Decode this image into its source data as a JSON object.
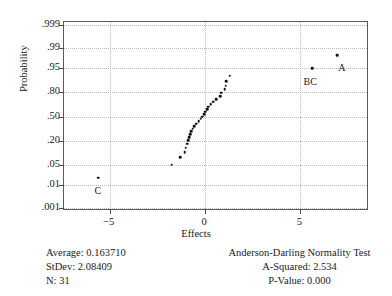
{
  "chart_data": {
    "type": "scatter",
    "title": "",
    "xlabel": "Effects",
    "ylabel": "Probability",
    "xlim": [
      -7.4,
      8.6
    ],
    "ylim_prob": [
      0.0007,
      0.9993
    ],
    "grid": true,
    "legend": "none",
    "x_ticks": [
      {
        "value": -5,
        "label": "−5"
      },
      {
        "value": 0,
        "label": "0"
      },
      {
        "value": 5,
        "label": "5"
      }
    ],
    "y_ticks": [
      {
        "value": 0.999,
        "label": ".999"
      },
      {
        "value": 0.99,
        "label": ".99"
      },
      {
        "value": 0.95,
        "label": ".95"
      },
      {
        "value": 0.8,
        "label": ".80"
      },
      {
        "value": 0.5,
        "label": ".50"
      },
      {
        "value": 0.2,
        "label": ".20"
      },
      {
        "value": 0.05,
        "label": ".05"
      },
      {
        "value": 0.01,
        "label": ".01"
      },
      {
        "value": 0.001,
        "label": ".001"
      }
    ],
    "points": [
      {
        "x": -5.62,
        "p": 0.019,
        "label": "C",
        "label_dx": 0,
        "label_dy": 7
      },
      {
        "x": -1.76,
        "p": 0.051,
        "label": "",
        "label_dx": 0,
        "label_dy": 0
      },
      {
        "x": -1.3,
        "p": 0.083,
        "label": "",
        "label_dx": 0,
        "label_dy": 0
      },
      {
        "x": -1.07,
        "p": 0.115,
        "label": "",
        "label_dx": 0,
        "label_dy": 0
      },
      {
        "x": -1.01,
        "p": 0.147,
        "label": "",
        "label_dx": 0,
        "label_dy": 0
      },
      {
        "x": -0.95,
        "p": 0.18,
        "label": "",
        "label_dx": 0,
        "label_dy": 0
      },
      {
        "x": -0.9,
        "p": 0.212,
        "label": "",
        "label_dx": 0,
        "label_dy": 0
      },
      {
        "x": -0.84,
        "p": 0.244,
        "label": "",
        "label_dx": 0,
        "label_dy": 0
      },
      {
        "x": -0.78,
        "p": 0.276,
        "label": "",
        "label_dx": 0,
        "label_dy": 0
      },
      {
        "x": -0.72,
        "p": 0.308,
        "label": "",
        "label_dx": 0,
        "label_dy": 0
      },
      {
        "x": -0.64,
        "p": 0.34,
        "label": "",
        "label_dx": 0,
        "label_dy": 0
      },
      {
        "x": -0.56,
        "p": 0.372,
        "label": "",
        "label_dx": 0,
        "label_dy": 0
      },
      {
        "x": -0.48,
        "p": 0.404,
        "label": "",
        "label_dx": 0,
        "label_dy": 0
      },
      {
        "x": -0.34,
        "p": 0.436,
        "label": "",
        "label_dx": 0,
        "label_dy": 0
      },
      {
        "x": -0.22,
        "p": 0.468,
        "label": "",
        "label_dx": 0,
        "label_dy": 0
      },
      {
        "x": -0.14,
        "p": 0.5,
        "label": "",
        "label_dx": 0,
        "label_dy": 0
      },
      {
        "x": -0.06,
        "p": 0.532,
        "label": "",
        "label_dx": 0,
        "label_dy": 0
      },
      {
        "x": 0.02,
        "p": 0.564,
        "label": "",
        "label_dx": 0,
        "label_dy": 0
      },
      {
        "x": 0.1,
        "p": 0.596,
        "label": "",
        "label_dx": 0,
        "label_dy": 0
      },
      {
        "x": 0.18,
        "p": 0.628,
        "label": "",
        "label_dx": 0,
        "label_dy": 0
      },
      {
        "x": 0.3,
        "p": 0.66,
        "label": "",
        "label_dx": 0,
        "label_dy": 0
      },
      {
        "x": 0.44,
        "p": 0.692,
        "label": "",
        "label_dx": 0,
        "label_dy": 0
      },
      {
        "x": 0.58,
        "p": 0.724,
        "label": "",
        "label_dx": 0,
        "label_dy": 0
      },
      {
        "x": 0.78,
        "p": 0.756,
        "label": "",
        "label_dx": 0,
        "label_dy": 0
      },
      {
        "x": 0.86,
        "p": 0.788,
        "label": "",
        "label_dx": 0,
        "label_dy": 0
      },
      {
        "x": 1.02,
        "p": 0.82,
        "label": "",
        "label_dx": 0,
        "label_dy": 0
      },
      {
        "x": 1.08,
        "p": 0.852,
        "label": "",
        "label_dx": 0,
        "label_dy": 0
      },
      {
        "x": 1.12,
        "p": 0.884,
        "label": "",
        "label_dx": 0,
        "label_dy": 0
      },
      {
        "x": 1.3,
        "p": 0.916,
        "label": "",
        "label_dx": 0,
        "label_dy": 0
      },
      {
        "x": 5.62,
        "p": 0.948,
        "label": "BC",
        "label_dx": -2,
        "label_dy": 8
      },
      {
        "x": 6.92,
        "p": 0.981,
        "label": "A",
        "label_dx": 5,
        "label_dy": 7
      }
    ]
  },
  "footer": {
    "left": [
      "Average: 0.163710",
      "StDev: 2.08409",
      "N: 31"
    ],
    "right": [
      "Anderson-Darling Normality Test",
      "A-Squared: 2.534",
      "P-Value: 0.000"
    ]
  }
}
